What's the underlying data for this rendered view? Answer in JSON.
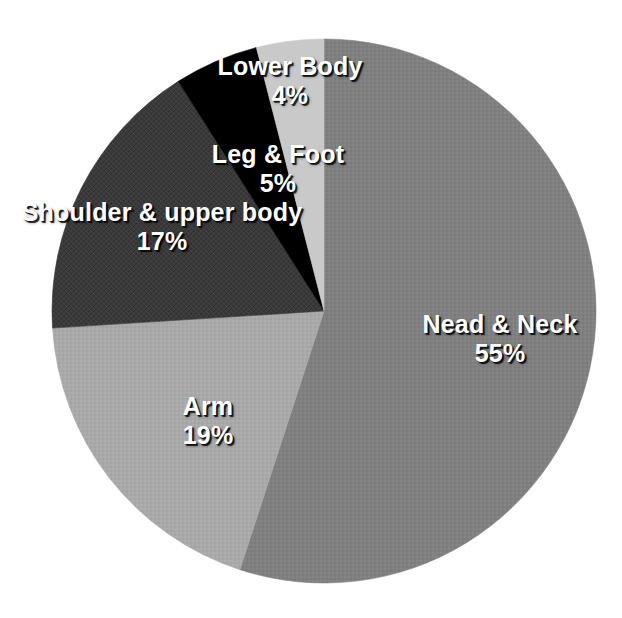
{
  "chart_data": {
    "type": "pie",
    "title": "",
    "legend": "none",
    "labels_position": "inside-slices",
    "start_angle_deg": 0,
    "direction": "clockwise",
    "categories": [
      "Nead & Neck",
      "Arm",
      "Shoulder & upper body",
      "Leg & Foot",
      "Lower Body"
    ],
    "values": [
      55,
      19,
      17,
      5,
      4
    ],
    "value_unit": "%",
    "value_labels": [
      "55%",
      "19%",
      "17%",
      "5%",
      "4%"
    ],
    "colors": [
      "#808080",
      "#a9a9a9",
      "#3b3b3b",
      "#000000",
      "#c9c9c9"
    ],
    "slices": [
      {
        "label": "Nead & Neck",
        "value": 55,
        "value_label": "55%",
        "color": "#808080"
      },
      {
        "label": "Arm",
        "value": 19,
        "value_label": "19%",
        "color": "#a9a9a9"
      },
      {
        "label": "Shoulder & upper body",
        "value": 17,
        "value_label": "17%",
        "color": "#3b3b3b"
      },
      {
        "label": "Leg & Foot",
        "value": 5,
        "value_label": "5%",
        "color": "#000000"
      },
      {
        "label": "Lower Body",
        "value": 4,
        "value_label": "4%",
        "color": "#c9c9c9"
      }
    ],
    "geometry": {
      "center_x": 324,
      "center_y": 311,
      "radius": 272
    },
    "background_color": "#ffffff",
    "label_text_color": "#ffffff"
  }
}
